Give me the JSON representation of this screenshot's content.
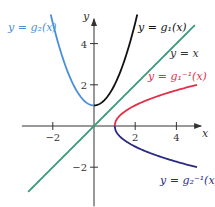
{
  "chart_data": {
    "type": "line",
    "title": "",
    "xlabel": "x",
    "ylabel": "y",
    "xlim": [
      -3.5,
      5.2
    ],
    "ylim": [
      -3.9,
      5.2
    ],
    "xticks": [
      -2,
      2,
      4
    ],
    "yticks": [
      -2,
      2,
      4
    ],
    "xtick_labels": [
      "−2",
      "2",
      "4"
    ],
    "ytick_labels": [
      "−2",
      "2",
      "4"
    ],
    "grid": false,
    "series": [
      {
        "name": "g2",
        "label": "y = g₂(x)",
        "color": "#4a90d9",
        "func": "x^2+1",
        "domain": [
          -2.1,
          0
        ]
      },
      {
        "name": "g1",
        "label": "y = g₁(x)",
        "color": "#111111",
        "func": "x^2+1",
        "domain": [
          0,
          2.1
        ]
      },
      {
        "name": "identity",
        "label": "y = x",
        "color": "#3a9a80",
        "func": "x",
        "domain": [
          -3.2,
          4.9
        ]
      },
      {
        "name": "g1-inverse",
        "label": "y = g₁⁻¹(x)",
        "color": "#e0304a",
        "func": "sqrt(x-1)",
        "domain": [
          1,
          5.0
        ]
      },
      {
        "name": "g2-inverse",
        "label": "y = g₂⁻¹(x)",
        "color": "#2a2a80",
        "func": "-sqrt(x-1)",
        "domain": [
          1,
          5.0
        ]
      }
    ]
  }
}
